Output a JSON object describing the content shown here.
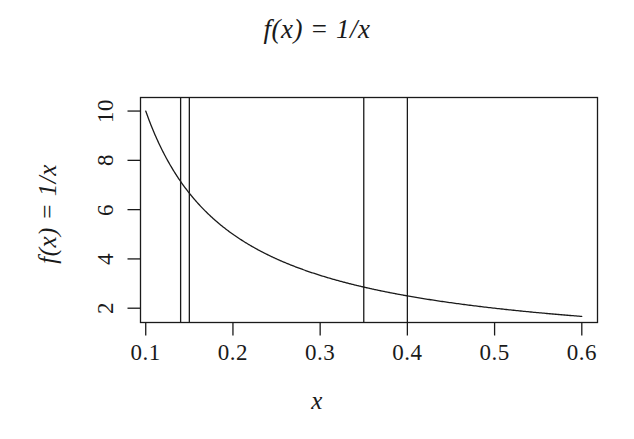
{
  "chart_data": {
    "type": "line",
    "title": "f(x) = 1/x",
    "xlabel": "x",
    "ylabel": "f(x) = 1/x",
    "xlim": [
      0.094,
      0.618
    ],
    "ylim": [
      1.42,
      10.55
    ],
    "grid": false,
    "legend": null,
    "series": [
      {
        "name": "f(x) = 1/x",
        "formula": "1/x",
        "color": "#1a1a1a",
        "x": [
          0.1,
          0.11,
          0.12,
          0.13,
          0.14,
          0.15,
          0.16,
          0.17,
          0.18,
          0.19,
          0.2,
          0.21,
          0.22,
          0.23,
          0.24,
          0.25,
          0.26,
          0.27,
          0.28,
          0.29,
          0.3,
          0.31,
          0.32,
          0.33,
          0.34,
          0.35,
          0.36,
          0.37,
          0.38,
          0.39,
          0.4,
          0.42,
          0.44,
          0.46,
          0.48,
          0.5,
          0.52,
          0.54,
          0.56,
          0.58,
          0.6
        ],
        "y": [
          10.0,
          9.09,
          8.33,
          7.69,
          7.14,
          6.67,
          6.25,
          5.88,
          5.56,
          5.26,
          5.0,
          4.76,
          4.55,
          4.35,
          4.17,
          4.0,
          3.85,
          3.7,
          3.57,
          3.45,
          3.33,
          3.23,
          3.13,
          3.03,
          2.94,
          2.86,
          2.78,
          2.7,
          2.63,
          2.56,
          2.5,
          2.38,
          2.27,
          2.17,
          2.08,
          2.0,
          1.92,
          1.85,
          1.79,
          1.72,
          1.67
        ]
      }
    ],
    "vlines": [
      {
        "x": 0.14,
        "label": "0.14",
        "color": "#1a1a1a"
      },
      {
        "x": 0.15,
        "label": "0.15",
        "color": "#1a1a1a"
      },
      {
        "x": 0.35,
        "label": "0.35",
        "color": "#1a1a1a"
      },
      {
        "x": 0.4,
        "label": "0.40",
        "color": "#1a1a1a"
      }
    ],
    "xticks": [
      {
        "value": 0.1,
        "label": "0.1"
      },
      {
        "value": 0.2,
        "label": "0.2"
      },
      {
        "value": 0.3,
        "label": "0.3"
      },
      {
        "value": 0.4,
        "label": "0.4"
      },
      {
        "value": 0.5,
        "label": "0.5"
      },
      {
        "value": 0.6,
        "label": "0.6"
      }
    ],
    "yticks": [
      {
        "value": 2,
        "label": "2"
      },
      {
        "value": 4,
        "label": "4"
      },
      {
        "value": 6,
        "label": "6"
      },
      {
        "value": 8,
        "label": "8"
      },
      {
        "value": 10,
        "label": "10"
      }
    ],
    "style": {
      "background": "#ffffff",
      "axis_color": "#1a1a1a",
      "line_width": 1.3,
      "box": true
    }
  }
}
